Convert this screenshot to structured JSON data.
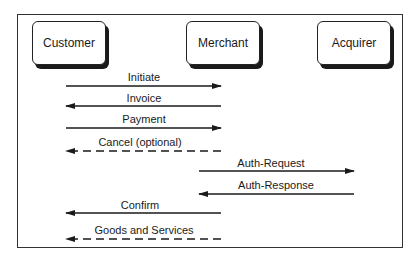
{
  "actors": [
    {
      "name": "Customer",
      "x": 32
    },
    {
      "name": "Merchant",
      "x": 186
    },
    {
      "name": "Acquirer",
      "x": 317
    }
  ],
  "messages": [
    {
      "label": "Initiate",
      "from": "Customer",
      "to": "Merchant",
      "style": "solid",
      "y": 86
    },
    {
      "label": "Invoice",
      "from": "Merchant",
      "to": "Customer",
      "style": "solid",
      "y": 106
    },
    {
      "label": "Payment",
      "from": "Customer",
      "to": "Merchant",
      "style": "solid",
      "y": 128
    },
    {
      "label": "Cancel (optional)",
      "from": "Merchant",
      "to": "Customer",
      "style": "dashed",
      "y": 151
    },
    {
      "label": "Auth-Request",
      "from": "Merchant",
      "to": "Acquirer",
      "style": "solid",
      "y": 171
    },
    {
      "label": "Auth-Response",
      "from": "Acquirer",
      "to": "Merchant",
      "style": "solid",
      "y": 194
    },
    {
      "label": "Confirm",
      "from": "Merchant",
      "to": "Customer",
      "style": "solid",
      "y": 213
    },
    {
      "label": "Goods and Services",
      "from": "Merchant",
      "to": "Customer",
      "style": "dashed",
      "y": 239
    }
  ]
}
